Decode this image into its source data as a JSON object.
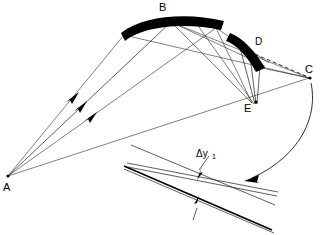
{
  "figure": {
    "labels": {
      "a": "A",
      "b": "B",
      "c": "C",
      "d": "D",
      "e": "E",
      "delta": "Δy",
      "delta_sub": "1"
    },
    "points": {
      "A": {
        "x": 8,
        "y": 176
      },
      "B": {
        "x": 163,
        "y": 8
      },
      "C": {
        "x": 312,
        "y": 77
      },
      "D": {
        "x": 259,
        "y": 41
      },
      "E": {
        "x": 249,
        "y": 107
      }
    },
    "colors": {
      "ink": "#000000",
      "line": "#1a1a1a",
      "background": "#ffffff"
    },
    "elements": {
      "mirror_b": "primary-concave-mirror-band",
      "mirror_d": "secondary-mirror-band",
      "rays_from_a": "three-incident-rays-with-arrowheads",
      "dashed_ray": "dashed-ray-to-c",
      "inset": "magnified-crossing-detail",
      "callout": "curved-callout-arrow"
    },
    "counts": {
      "rays_from_a": 3,
      "arrowheads_on_rays": 3,
      "inset_arrows": 2,
      "mirrors": 2
    }
  }
}
